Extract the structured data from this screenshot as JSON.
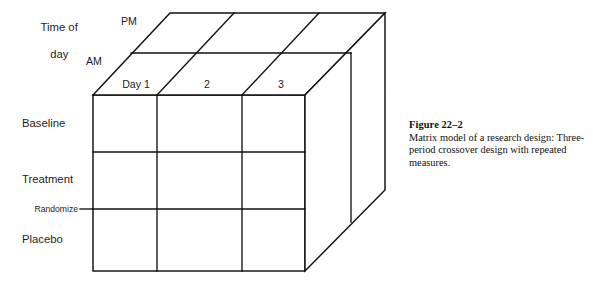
{
  "figure": {
    "caption_title": "Figure 22–2",
    "caption_body": "Matrix model of a research design: Three-period crossover design with repeated measures."
  },
  "axes": {
    "time_of_day_label": "Time of\nday",
    "time_of_day_line1": "Time of",
    "time_of_day_line2": "day",
    "pm_label": "PM",
    "am_label": "AM"
  },
  "columns": [
    {
      "label": "Day 1"
    },
    {
      "label": "2"
    },
    {
      "label": "3"
    }
  ],
  "rows": [
    {
      "label": "Baseline"
    },
    {
      "label": "Treatment"
    },
    {
      "label": "Placebo"
    }
  ],
  "annotations": {
    "randomize_label": "Randomize"
  },
  "colors": {
    "line": "#111111",
    "face": "#ffffff",
    "text": "#1d1d1d"
  }
}
